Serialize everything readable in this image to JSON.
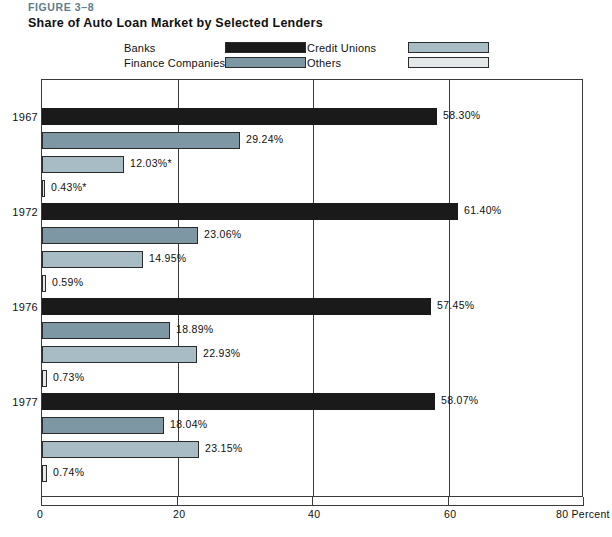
{
  "figure": {
    "number": "FIGURE 3–8",
    "title": "Share of Auto Loan Market by Selected Lenders",
    "number_color": "#5e7d8e"
  },
  "legend": {
    "entries": [
      {
        "label": "Banks",
        "color": "#1a1a1a",
        "key": "banks"
      },
      {
        "label": "Finance Companies",
        "color": "#7d97a5",
        "key": "finance_companies"
      },
      {
        "label": "Credit Unions",
        "color": "#a8bcc6",
        "key": "credit_unions"
      },
      {
        "label": "Others",
        "color": "#e3e8e8",
        "key": "others"
      }
    ]
  },
  "axis": {
    "ticks": [
      "0",
      "20",
      "40",
      "60"
    ],
    "tick_values": [
      0,
      20,
      40,
      60
    ],
    "end_tick": "80",
    "unit_label": "80 Percent",
    "min": 0,
    "max": 80
  },
  "chart_data": {
    "type": "bar",
    "orientation": "horizontal",
    "title": "Share of Auto Loan Market by Selected Lenders",
    "xlabel": "Percent",
    "ylabel": "",
    "xlim": [
      0,
      80
    ],
    "xticks": [
      0,
      20,
      40,
      60,
      80
    ],
    "grid": true,
    "legend_position": "top",
    "categories": [
      "1967",
      "1972",
      "1976",
      "1977"
    ],
    "series": [
      {
        "name": "Banks",
        "color": "#1a1a1a",
        "values": [
          58.3,
          61.4,
          57.45,
          58.07
        ],
        "labels": [
          "58.30%",
          "61.40%",
          "57.45%",
          "58.07%"
        ]
      },
      {
        "name": "Finance Companies",
        "color": "#7d97a5",
        "values": [
          29.24,
          23.06,
          18.89,
          18.04
        ],
        "labels": [
          "29.24%",
          "23.06%",
          "18.89%",
          "18.04%"
        ]
      },
      {
        "name": "Credit Unions",
        "color": "#a8bcc6",
        "values": [
          12.03,
          14.95,
          22.93,
          23.15
        ],
        "labels": [
          "12.03%*",
          "14.95%",
          "22.93%",
          "23.15%"
        ]
      },
      {
        "name": "Others",
        "color": "#e3e8e8",
        "values": [
          0.43,
          0.59,
          0.73,
          0.74
        ],
        "labels": [
          "0.43%*",
          "0.59%",
          "0.73%",
          "0.74%"
        ]
      }
    ],
    "annotations": [
      "* denotes values marked with an asterisk in the 1967 group"
    ]
  }
}
